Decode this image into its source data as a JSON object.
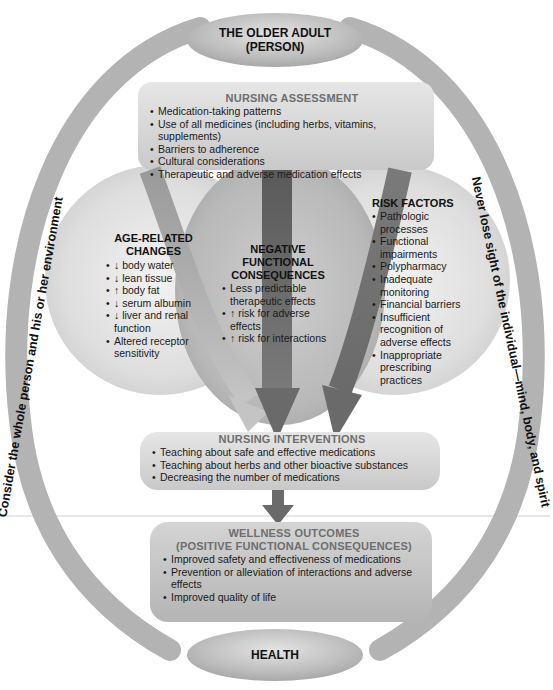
{
  "figure": {
    "top_oval": {
      "line1": "THE OLDER ADULT",
      "line2": "(PERSON)"
    },
    "bottom_oval": {
      "label": "HEALTH"
    },
    "left_arc_text": "Consider the whole person and his or her environment",
    "right_arc_text": "Never lose sight of the individual—mind, body, and spirit",
    "nursing_assessment": {
      "title": "NURSING ASSESSMENT",
      "items": [
        "Medication-taking patterns",
        "Use of all medicines (including herbs, vitamins, supplements)",
        "Barriers to adherence",
        "Cultural considerations",
        "Therapeutic and adverse medication effects"
      ]
    },
    "age_related_changes": {
      "title_line1": "AGE-RELATED",
      "title_line2": "CHANGES",
      "items": [
        "↓ body water",
        "↓ lean tissue",
        "↑ body fat",
        "↓ serum albumin",
        "↓ liver and renal function",
        "Altered receptor sensitivity"
      ]
    },
    "negative_functional_consequences": {
      "title_line1": "NEGATIVE",
      "title_line2": "FUNCTIONAL",
      "title_line3": "CONSEQUENCES",
      "items": [
        "Less predictable therapeutic effects",
        "↑ risk for adverse effects",
        "↑ risk for interactions"
      ]
    },
    "risk_factors": {
      "title": "RISK FACTORS",
      "items": [
        "Pathologic processes",
        "Functional impairments",
        "Polypharmacy",
        "Inadequate monitoring",
        "Financial barriers",
        "Insufficient recognition of adverse effects",
        "Inappropriate prescribing practices"
      ]
    },
    "nursing_interventions": {
      "title": "NURSING INTERVENTIONS",
      "items": [
        "Teaching about safe and effective medications",
        "Teaching about herbs and other bioactive substances",
        "Decreasing the number of medications"
      ]
    },
    "wellness_outcomes": {
      "title_line1": "WELLNESS OUTCOMES",
      "title_line2": "(POSITIVE FUNCTIONAL CONSEQUENCES)",
      "items": [
        "Improved safety and effectiveness of medications",
        "Prevention or alleviation of interactions and adverse effects",
        "Improved quality of life"
      ]
    }
  }
}
